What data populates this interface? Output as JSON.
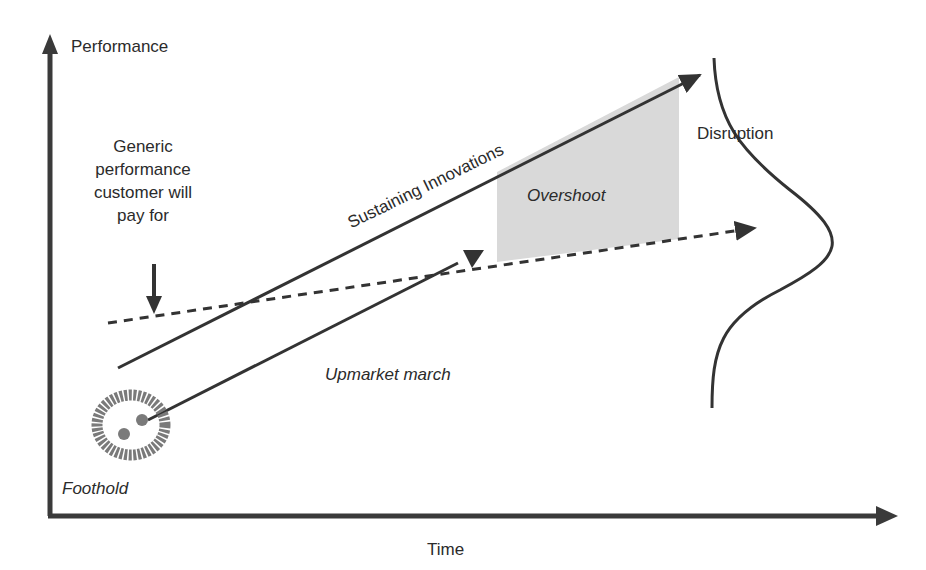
{
  "diagram": {
    "axes": {
      "y_label": "Performance",
      "x_label": "Time"
    },
    "labels": {
      "generic_line1": "Generic",
      "generic_line2": "performance",
      "generic_line3": "customer will",
      "generic_line4": "pay for",
      "sustaining": "Sustaining Innovations",
      "overshoot": "Overshoot",
      "disruption": "Disruption",
      "upmarket": "Upmarket march",
      "foothold": "Foothold"
    },
    "colors": {
      "line": "#333333",
      "overshoot_fill": "#d9d9d9",
      "foothold_blob": "#7a7a7a"
    }
  }
}
